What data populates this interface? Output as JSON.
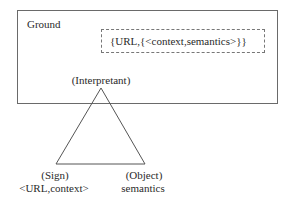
{
  "diagram": {
    "ground": {
      "label": "Ground"
    },
    "ground_expression": "{URL,{<context,semantics>}}",
    "triangle": {
      "apex": {
        "label": "(Interpretant)"
      },
      "left": {
        "label": "(Sign)",
        "value": "<URL,context>"
      },
      "right": {
        "label": "(Object)",
        "value": "semantics"
      }
    },
    "colors": {
      "line": "#555555",
      "text": "#2a2a2a",
      "background": "#ffffff"
    }
  }
}
